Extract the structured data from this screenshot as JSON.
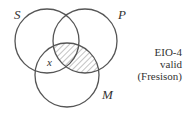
{
  "diagram": {
    "type": "venn",
    "sets": [
      {
        "label": "S",
        "cx": 47,
        "cy": 41,
        "r": 32
      },
      {
        "label": "P",
        "cx": 85,
        "cy": 41,
        "r": 32
      },
      {
        "label": "M",
        "cx": 67,
        "cy": 75,
        "r": 32
      }
    ],
    "shaded_region": "P∩M (excluding nothing marked) hatched",
    "x_mark": "x",
    "labels": {
      "s": "S",
      "p": "P",
      "m": "M"
    },
    "caption": [
      "EIO-4",
      "valid",
      "(Fresison)"
    ],
    "stroke_color": "#555555",
    "hatch_color": "#888888"
  }
}
